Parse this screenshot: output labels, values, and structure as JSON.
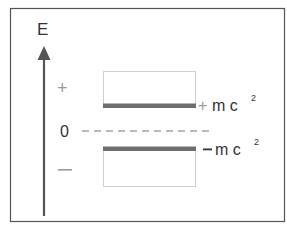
{
  "diagram": {
    "axis_label": "E",
    "positive_region_symbol": "+",
    "zero_label": "0",
    "negative_region_symbol": "−",
    "upper_level": {
      "sign": "+",
      "label": "m c",
      "superscript": "2"
    },
    "lower_level": {
      "sign": "−",
      "label": "m c",
      "superscript": "2"
    },
    "colors": {
      "frame": "#555555",
      "axis": "#555555",
      "level_bar": "#6e6e6e",
      "box_outline": "#d0d0d0",
      "dashed_line": "#777777",
      "text": "#333333",
      "region_symbol": "#9a9a9a"
    }
  }
}
